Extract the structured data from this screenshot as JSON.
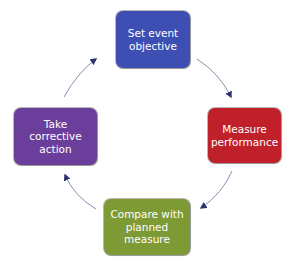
{
  "diagram": {
    "type": "cycle",
    "direction": "clockwise",
    "nodes": [
      {
        "id": "set",
        "label": "Set event\nobjective",
        "color": "#3E4FB3",
        "position": "top"
      },
      {
        "id": "measure",
        "label": "Measure\nperformance",
        "color": "#C0202A",
        "position": "right"
      },
      {
        "id": "compare",
        "label": "Compare with\nplanned\nmeasure",
        "color": "#7E9A35",
        "position": "bottom"
      },
      {
        "id": "correct",
        "label": "Take\ncorrective\naction",
        "color": "#6A3E9A",
        "position": "left"
      }
    ],
    "edges": [
      {
        "from": "set",
        "to": "measure"
      },
      {
        "from": "measure",
        "to": "compare"
      },
      {
        "from": "compare",
        "to": "correct"
      },
      {
        "from": "correct",
        "to": "set"
      }
    ],
    "arrow_color": "#3A3F7A"
  }
}
